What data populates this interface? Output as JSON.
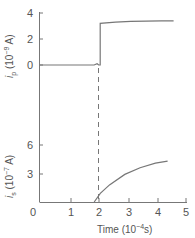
{
  "chart_data": [
    {
      "type": "line",
      "panel": "top",
      "ylabel": "i_p (10^-9 A)",
      "ylabel_parts": {
        "var": "i",
        "sub": "p",
        "unit_pre": "(10",
        "exp": "−9",
        "unit_post": " A)"
      },
      "yticks": [
        "0",
        "2",
        "4"
      ],
      "ylim": [
        0,
        4
      ],
      "x": [
        0.0,
        1.0,
        1.8,
        1.9,
        1.95,
        2.0,
        2.0,
        2.5,
        3.0,
        3.5,
        4.0,
        4.4
      ],
      "y": [
        0.0,
        0.0,
        0.0,
        0.1,
        0.0,
        0.0,
        3.2,
        3.3,
        3.35,
        3.38,
        3.4,
        3.4
      ],
      "annotation": "step at t = 2 (dashed marker)"
    },
    {
      "type": "line",
      "panel": "bottom",
      "ylabel": "i_s (10^-7 A)",
      "ylabel_parts": {
        "var": "i",
        "sub": "s",
        "unit_pre": "(10",
        "exp": "−7",
        "unit_post": " A)"
      },
      "yticks": [
        "3",
        "6"
      ],
      "ylim": [
        0,
        6
      ],
      "xlabel": "Time (10^-4 s)",
      "xticks": [
        "0",
        "1",
        "2",
        "3",
        "4",
        "5"
      ],
      "xlim": [
        0,
        5
      ],
      "x": [
        2.0,
        2.2,
        2.5,
        3.0,
        3.5,
        4.0,
        4.4
      ],
      "y": [
        0.0,
        0.9,
        1.8,
        2.9,
        3.6,
        4.1,
        4.3
      ]
    }
  ],
  "axes": {
    "x_label_word": "Time",
    "x_label_unit_pre": "(10",
    "x_label_exp": "−4",
    "x_label_unit_post": "s)"
  },
  "colors": {
    "line": "#777777",
    "text": "#555555"
  }
}
